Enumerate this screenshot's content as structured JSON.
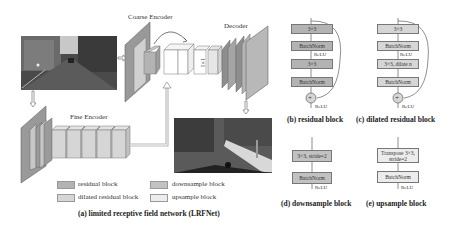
{
  "figure": {
    "panel_a": {
      "labels": {
        "coarse_encoder": "Coarse Encoder",
        "decoder": "Decoder",
        "fine_encoder": "Fine Encoder",
        "conv1x1": "1×1"
      },
      "legend": [
        {
          "label": "residual block",
          "color": "#b3b3b3"
        },
        {
          "label": "downsample block",
          "color": "#c2c2c2"
        },
        {
          "label": "dilated residual block",
          "color": "#d6d6d6"
        },
        {
          "label": "upsample block",
          "color": "#ececec"
        }
      ],
      "caption": "(a) limited receptive  field network (LRFNet)",
      "input_image": "street scene photo",
      "output_image": "segmentation map"
    },
    "panel_b": {
      "caption": "(b) residual block",
      "layers": [
        "3×3",
        "BatchNorm",
        "3×3",
        "BatchNorm"
      ],
      "relu_mid": "ReLU",
      "relu_out": "ReLU",
      "add": "+"
    },
    "panel_c": {
      "caption": "(c) dilated residual block",
      "layers": [
        "3×3",
        "BatchNorm",
        "3×3, dilate n",
        "BatchNorm"
      ],
      "relu_mid": "ReLU",
      "relu_out": "ReLU",
      "add": "+"
    },
    "panel_d": {
      "caption": "(d) downsample block",
      "layers": [
        "3×3, stride=2",
        "BatchNorm"
      ],
      "relu_out": "ReLU"
    },
    "panel_e": {
      "caption": "(e) upsample block",
      "layers": [
        "Transpose 3×3, stride=2",
        "BatchNorm"
      ],
      "relu_out": "ReLU"
    },
    "colors": {
      "residual": "#b3b3b3",
      "dilated": "#d6d6d6",
      "downsample": "#c2c2c2",
      "upsample": "#ececec"
    }
  }
}
